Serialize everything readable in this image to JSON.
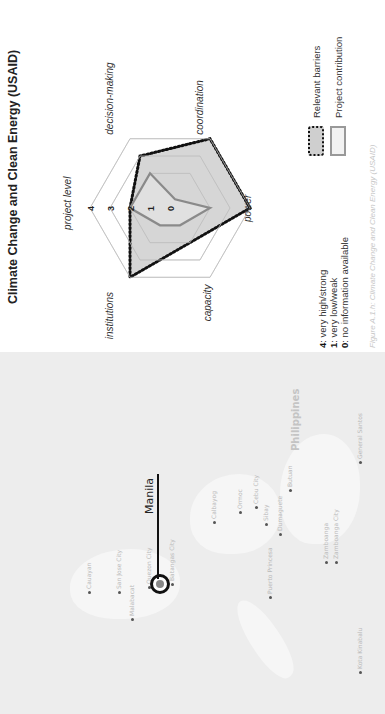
{
  "map": {
    "country_label": "Philippines",
    "highlight_city": "Manila",
    "cities": [
      {
        "name": "Cauayan",
        "x": 120,
        "y": 85
      },
      {
        "name": "San Jose City",
        "x": 120,
        "y": 115
      },
      {
        "name": "Malabacat",
        "x": 93,
        "y": 128
      },
      {
        "name": "Quezon City",
        "x": 125,
        "y": 145
      },
      {
        "name": "Batangas City",
        "x": 128,
        "y": 168
      },
      {
        "name": "Calbayog",
        "x": 190,
        "y": 210
      },
      {
        "name": "Ormoc",
        "x": 200,
        "y": 236
      },
      {
        "name": "Sibay",
        "x": 188,
        "y": 262
      },
      {
        "name": "Cebu City",
        "x": 205,
        "y": 252
      },
      {
        "name": "Butuan",
        "x": 222,
        "y": 286
      },
      {
        "name": "Dumaguete",
        "x": 178,
        "y": 276
      },
      {
        "name": "Puerto Princesa",
        "x": 115,
        "y": 266
      },
      {
        "name": "Zamboanga",
        "x": 150,
        "y": 322
      },
      {
        "name": "Zamboanga City",
        "x": 150,
        "y": 332
      },
      {
        "name": "General Santos",
        "x": 250,
        "y": 356
      },
      {
        "name": "Kota Kinabalu",
        "x": 40,
        "y": 356
      }
    ]
  },
  "chart": {
    "title": "Climate Change and Clean Energy (USAID)",
    "scale_key": [
      {
        "value": "4",
        "text": ": very high/strong"
      },
      {
        "value": "1",
        "text": ": very low/weak"
      },
      {
        "value": "0",
        "text": ": no information available"
      }
    ],
    "legend": {
      "barriers": "Relevant barriers",
      "contribution": "Project contribution"
    },
    "caption": "Figure A.1.h: Climate Change and Clean Energy (USAID)"
  },
  "chart_data": {
    "type": "radar",
    "title": "Climate Change and Clean Energy (USAID)",
    "axes": [
      "project level",
      "decision-making",
      "coordination",
      "power",
      "capacity",
      "institutions"
    ],
    "tick_labels": [
      "0",
      "1",
      "2",
      "3",
      "4"
    ],
    "range": [
      0,
      4
    ],
    "grid_rings": [
      2,
      3,
      4
    ],
    "series": [
      {
        "name": "Relevant barriers",
        "style": "dotted-filled",
        "values": [
          2,
          3,
          4,
          4,
          2,
          4
        ]
      },
      {
        "name": "Project contribution",
        "style": "solid-outline",
        "values": [
          2,
          2,
          0.5,
          2,
          1,
          1
        ]
      }
    ],
    "legend_position": "bottom-right",
    "colors": {
      "barriers_fill": "#cfcfcf",
      "barriers_stroke": "#111111",
      "contribution_stroke": "#8a8a8a",
      "grid": "#dddddd"
    }
  }
}
